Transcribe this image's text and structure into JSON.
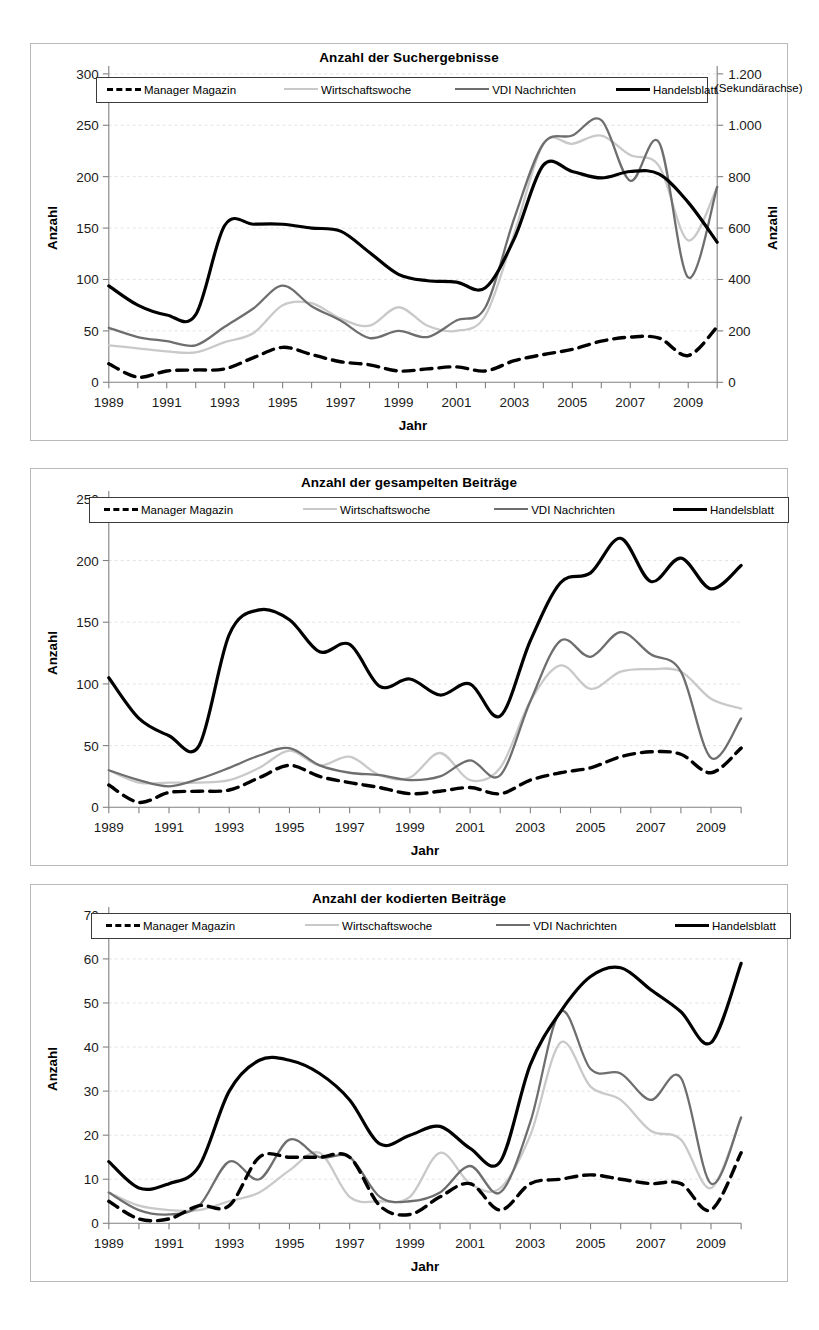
{
  "page": {
    "charts": [
      {
        "id": "suchergebnisse",
        "title": "Anzahl der Suchergebnisse",
        "secondary_note": "(Sekundärachse)",
        "xlabel": "Jahr",
        "ylabel": "Anzahl",
        "y2label": "Anzahl"
      },
      {
        "id": "gesampelte",
        "title": "Anzahl der gesampelten Beiträge",
        "xlabel": "Jahr",
        "ylabel": "Anzahl"
      },
      {
        "id": "kodierte",
        "title": "Anzahl der kodierten Beiträge",
        "xlabel": "Jahr",
        "ylabel": "Anzahl"
      }
    ],
    "legend_entries": [
      {
        "label": "Manager Magazin",
        "style": "dashed",
        "color": "#000000"
      },
      {
        "label": "Wirtschaftswoche",
        "style": "solid",
        "color": "#c9c9c9"
      },
      {
        "label": "VDI Nachrichten",
        "style": "solid",
        "color": "#6e6e6e"
      },
      {
        "label": "Handelsblatt",
        "style": "solid-thick",
        "color": "#000000"
      }
    ]
  },
  "chart_data": [
    {
      "type": "line",
      "title": "Anzahl der Suchergebnisse",
      "xlabel": "Jahr",
      "ylabel": "Anzahl",
      "y2label": "Anzahl",
      "grid": true,
      "legend_position": "top",
      "annotation": "(Sekundärachse)",
      "x": [
        1989,
        1990,
        1991,
        1992,
        1993,
        1994,
        1995,
        1996,
        1997,
        1998,
        1999,
        2000,
        2001,
        2002,
        2003,
        2004,
        2005,
        2006,
        2007,
        2008,
        2009,
        2010
      ],
      "xlim": [
        1989,
        2010
      ],
      "xticks": [
        1989,
        1991,
        1993,
        1995,
        1997,
        1999,
        2001,
        2003,
        2005,
        2007,
        2009
      ],
      "ylim": [
        0,
        300
      ],
      "yticks": [
        0,
        50,
        100,
        150,
        200,
        250,
        300
      ],
      "y2lim": [
        0,
        1200
      ],
      "y2ticks": [
        0,
        200,
        400,
        600,
        800,
        1000,
        1200
      ],
      "y2ticklabels": [
        "0",
        "200",
        "400",
        "600",
        "800",
        "1.000",
        "1.200"
      ],
      "series": [
        {
          "name": "Manager Magazin",
          "axis": "left",
          "style": "dashed",
          "color": "#000000",
          "values": [
            18,
            5,
            11,
            12,
            13,
            24,
            34,
            27,
            20,
            17,
            11,
            13,
            15,
            11,
            21,
            27,
            32,
            40,
            44,
            43,
            26,
            54
          ]
        },
        {
          "name": "Wirtschaftswoche",
          "axis": "left",
          "style": "solid",
          "color": "#c9c9c9",
          "values": [
            36,
            33,
            30,
            29,
            39,
            48,
            75,
            77,
            62,
            55,
            73,
            55,
            50,
            65,
            145,
            232,
            232,
            240,
            221,
            210,
            138,
            190
          ]
        },
        {
          "name": "VDI Nachrichten",
          "axis": "left",
          "style": "solid",
          "color": "#6e6e6e",
          "values": [
            53,
            44,
            40,
            36,
            54,
            72,
            94,
            74,
            60,
            43,
            50,
            44,
            60,
            73,
            160,
            232,
            240,
            255,
            196,
            233,
            102,
            190
          ]
        },
        {
          "name": "Handelsblatt",
          "axis": "right",
          "style": "solid-thick",
          "color": "#000000",
          "values": [
            375,
            300,
            262,
            263,
            610,
            615,
            615,
            600,
            588,
            505,
            420,
            395,
            390,
            368,
            560,
            845,
            820,
            795,
            820,
            810,
            700,
            545
          ]
        }
      ]
    },
    {
      "type": "line",
      "title": "Anzahl der gesampelten Beiträge",
      "xlabel": "Jahr",
      "ylabel": "Anzahl",
      "grid": true,
      "legend_position": "top",
      "x": [
        1989,
        1990,
        1991,
        1992,
        1993,
        1994,
        1995,
        1996,
        1997,
        1998,
        1999,
        2000,
        2001,
        2002,
        2003,
        2004,
        2005,
        2006,
        2007,
        2008,
        2009,
        2010
      ],
      "xlim": [
        1989,
        2010
      ],
      "xticks": [
        1989,
        1991,
        1993,
        1995,
        1997,
        1999,
        2001,
        2003,
        2005,
        2007,
        2009
      ],
      "ylim": [
        0,
        250
      ],
      "yticks": [
        0,
        50,
        100,
        150,
        200,
        250
      ],
      "series": [
        {
          "name": "Manager Magazin",
          "style": "dashed",
          "color": "#000000",
          "values": [
            18,
            4,
            12,
            13,
            14,
            24,
            34,
            25,
            20,
            16,
            11,
            13,
            16,
            11,
            22,
            28,
            32,
            41,
            45,
            43,
            28,
            48
          ]
        },
        {
          "name": "Wirtschaftswoche",
          "style": "solid",
          "color": "#c9c9c9",
          "values": [
            30,
            20,
            20,
            20,
            22,
            32,
            46,
            34,
            41,
            26,
            24,
            44,
            22,
            32,
            86,
            115,
            96,
            110,
            112,
            110,
            88,
            80
          ]
        },
        {
          "name": "VDI Nachrichten",
          "style": "solid",
          "color": "#6e6e6e",
          "values": [
            30,
            22,
            17,
            23,
            32,
            42,
            48,
            34,
            28,
            26,
            22,
            25,
            38,
            26,
            86,
            135,
            122,
            142,
            124,
            110,
            40,
            72
          ]
        },
        {
          "name": "Handelsblatt",
          "style": "solid-thick",
          "color": "#000000",
          "values": [
            105,
            72,
            58,
            50,
            140,
            160,
            152,
            126,
            132,
            98,
            104,
            91,
            100,
            74,
            135,
            182,
            190,
            218,
            183,
            202,
            177,
            196
          ]
        }
      ]
    },
    {
      "type": "line",
      "title": "Anzahl der kodierten Beiträge",
      "xlabel": "Jahr",
      "ylabel": "Anzahl",
      "grid": true,
      "legend_position": "top",
      "x": [
        1989,
        1990,
        1991,
        1992,
        1993,
        1994,
        1995,
        1996,
        1997,
        1998,
        1999,
        2000,
        2001,
        2002,
        2003,
        2004,
        2005,
        2006,
        2007,
        2008,
        2009,
        2010
      ],
      "xlim": [
        1989,
        2010
      ],
      "xticks": [
        1989,
        1991,
        1993,
        1995,
        1997,
        1999,
        2001,
        2003,
        2005,
        2007,
        2009
      ],
      "ylim": [
        0,
        70
      ],
      "yticks": [
        0,
        10,
        20,
        30,
        40,
        50,
        60,
        70
      ],
      "series": [
        {
          "name": "Manager Magazin",
          "style": "dashed",
          "color": "#000000",
          "values": [
            5,
            1,
            1,
            4,
            4,
            15,
            15,
            15,
            15,
            4,
            2,
            6,
            9,
            3,
            9,
            10,
            11,
            10,
            9,
            9,
            3,
            16
          ]
        },
        {
          "name": "Wirtschaftswoche",
          "style": "solid",
          "color": "#c9c9c9",
          "values": [
            7,
            4,
            3,
            3,
            5,
            7,
            12,
            16,
            6,
            5,
            6,
            16,
            9,
            8,
            20,
            41,
            31,
            28,
            21,
            19,
            8,
            24
          ]
        },
        {
          "name": "VDI Nachrichten",
          "style": "solid",
          "color": "#6e6e6e",
          "values": [
            7,
            3,
            2,
            4,
            14,
            10,
            19,
            15,
            15,
            6,
            5,
            7,
            13,
            7,
            23,
            48,
            35,
            34,
            28,
            33,
            9,
            24
          ]
        },
        {
          "name": "Handelsblatt",
          "style": "solid-thick",
          "color": "#000000",
          "values": [
            14,
            8,
            9,
            13,
            30,
            37,
            37,
            34,
            28,
            18,
            20,
            22,
            17,
            14,
            36,
            48,
            56,
            58,
            53,
            48,
            41,
            59
          ]
        }
      ]
    }
  ]
}
